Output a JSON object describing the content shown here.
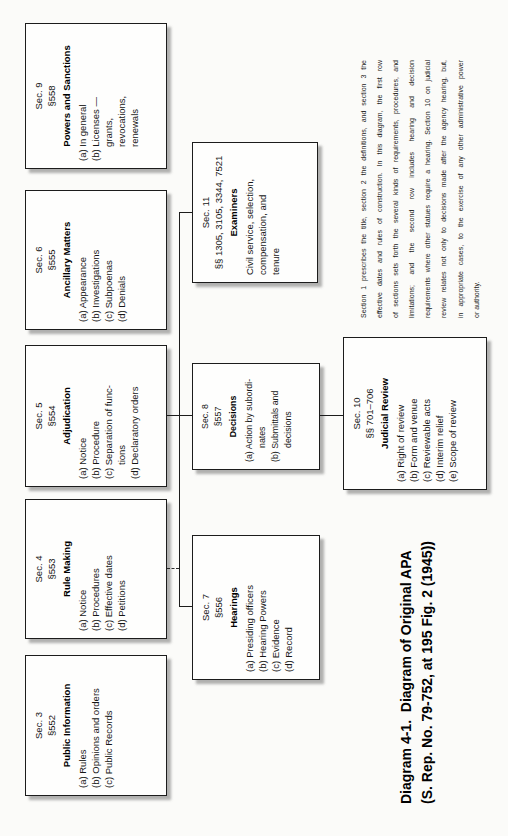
{
  "figure": {
    "caption": {
      "line1": "Diagram 4-1.  Diagram of Original APA",
      "line2": "(S. Rep. No. 79-752, at 195 Fig. 2 (1945))"
    },
    "note_lines": [
      "Section 1 prescribes the title, section 2 the definitions, and section 3 the",
      "effective dates and rules of construction. In this diagram, the first row",
      "of sections sets forth the several kinds of requirements, procedures, and",
      "limitations; and the second row includes hearing and decision",
      "requirements where other statues require a hearing. Section 10 on judicial",
      "review relates not only to decisions made after the agency hearing, but,",
      "in appropriate cases, to the exercise of any other administrative power",
      "or authority."
    ]
  },
  "boxes": [
    {
      "key": "sec3",
      "sec": "Sec. 3",
      "cite": "§552",
      "title": "Public Information",
      "items": [
        {
          "label": "(a)",
          "lines": [
            "Rules"
          ]
        },
        {
          "label": "(b)",
          "lines": [
            "Opinions and orders"
          ]
        },
        {
          "label": "(c)",
          "lines": [
            "Public Records"
          ]
        }
      ]
    },
    {
      "key": "sec4",
      "sec": "Sec. 4",
      "cite": "§553",
      "title": "Rule Making",
      "items": [
        {
          "label": "(a)",
          "lines": [
            "Notice"
          ]
        },
        {
          "label": "(b)",
          "lines": [
            "Procedures"
          ]
        },
        {
          "label": "(c)",
          "lines": [
            "Effective dates"
          ]
        },
        {
          "label": "(d)",
          "lines": [
            "Petitions"
          ]
        }
      ]
    },
    {
      "key": "sec5",
      "sec": "Sec. 5",
      "cite": "§554",
      "title": "Adjudication",
      "items": [
        {
          "label": "(a)",
          "lines": [
            "Notice"
          ]
        },
        {
          "label": "(b)",
          "lines": [
            "Procedure"
          ]
        },
        {
          "label": "(c)",
          "lines": [
            "Separation of func-",
            "tions"
          ]
        },
        {
          "label": "(d)",
          "lines": [
            "Declaratory orders"
          ]
        }
      ]
    },
    {
      "key": "sec6",
      "sec": "Sec. 6",
      "cite": "§555",
      "title": "Ancillary Matters",
      "items": [
        {
          "label": "(a)",
          "lines": [
            "Appearance"
          ]
        },
        {
          "label": "(b)",
          "lines": [
            "Investigations"
          ]
        },
        {
          "label": "(c)",
          "lines": [
            "Subpoenas"
          ]
        },
        {
          "label": "(d)",
          "lines": [
            "Denials"
          ]
        }
      ]
    },
    {
      "key": "sec9",
      "sec": "Sec. 9",
      "cite": "§558",
      "title": "Powers and Sanctions",
      "items": [
        {
          "label": "(a)",
          "lines": [
            "In general"
          ]
        },
        {
          "label": "(b)",
          "lines": [
            "Licenses —",
            "grants,",
            "revocations,",
            "renewals"
          ]
        }
      ]
    },
    {
      "key": "sec7",
      "sec": "Sec. 7",
      "cite": "§556",
      "title": "Hearings",
      "items": [
        {
          "label": "(a)",
          "lines": [
            "Presiding officers"
          ]
        },
        {
          "label": "(b)",
          "lines": [
            "Hearing Powers"
          ]
        },
        {
          "label": "(c)",
          "lines": [
            "Evidence"
          ]
        },
        {
          "label": "(d)",
          "lines": [
            "Record"
          ]
        }
      ]
    },
    {
      "key": "sec8",
      "sec": "Sec. 8",
      "cite": "§557",
      "title": "Decisions",
      "items": [
        {
          "label": "(a)",
          "lines": [
            "Action by subordi-",
            "nates"
          ]
        },
        {
          "label": "(b)",
          "lines": [
            "Submittals and",
            "decisions"
          ]
        }
      ]
    },
    {
      "key": "sec11",
      "sec": "Sec. 11",
      "cite": "§§ 1305, 3105, 3344, 7521",
      "title": "Examiners",
      "items": [
        {
          "label": "",
          "lines": [
            "Civil service, selection,",
            "compensation, and",
            "tenure"
          ]
        }
      ]
    },
    {
      "key": "sec10",
      "sec": "Sec. 10",
      "cite": "§§ 701–706",
      "title": "Judicial Review",
      "items": [
        {
          "label": "(a)",
          "lines": [
            "Right of review"
          ]
        },
        {
          "label": "(b)",
          "lines": [
            "Form and venue"
          ]
        },
        {
          "label": "(c)",
          "lines": [
            "Reviewable acts"
          ]
        },
        {
          "label": "(d)",
          "lines": [
            "Interim relief"
          ]
        },
        {
          "label": "(e)",
          "lines": [
            "Scope of review"
          ]
        }
      ]
    }
  ]
}
